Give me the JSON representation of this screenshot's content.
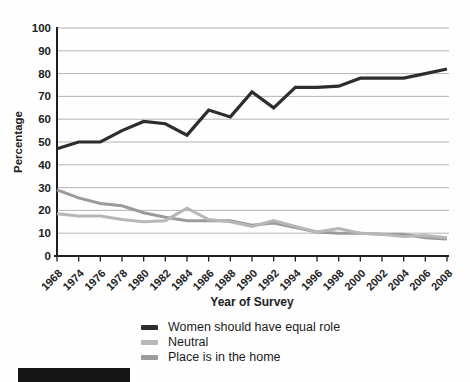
{
  "figure": {
    "ylabel": "Percentage",
    "xlabel": "Year of Survey"
  },
  "chart_data": {
    "type": "line",
    "title": "",
    "xlabel": "Year of Survey",
    "ylabel": "Percentage",
    "ylim": [
      0,
      100
    ],
    "ytick_step": 10,
    "grid": true,
    "legend_position": "bottom",
    "categories": [
      "1968",
      "1974",
      "1976",
      "1978",
      "1980",
      "1982",
      "1984",
      "1986",
      "1988",
      "1990",
      "1992",
      "1994",
      "1996",
      "1998",
      "2000",
      "2002",
      "2004",
      "2006",
      "2008"
    ],
    "series": [
      {
        "name": "Women should have equal role",
        "color": "#2d2d2d",
        "stroke_width": 3.2,
        "values": [
          47,
          50,
          50,
          55,
          59,
          58,
          53,
          64,
          61,
          72,
          65,
          74,
          74,
          74.5,
          78,
          78,
          78,
          80,
          82
        ]
      },
      {
        "name": "Neutral",
        "color": "#b7b7b7",
        "stroke_width": 3,
        "values": [
          18.5,
          17.5,
          17.5,
          16,
          15,
          15.5,
          21,
          16,
          15,
          13,
          15.5,
          13,
          10.5,
          12,
          10,
          9.5,
          8.5,
          9,
          8
        ]
      },
      {
        "name": "Place is in the home",
        "color": "#9b9b9b",
        "stroke_width": 3,
        "values": [
          29,
          25.5,
          23,
          22,
          19,
          17,
          15.5,
          15.5,
          15.5,
          13.5,
          14.5,
          12.5,
          10.5,
          10,
          10,
          9.5,
          9.5,
          8,
          7.5
        ]
      }
    ],
    "colors": {
      "grid": "#ababab",
      "axis": "#1f1f1f",
      "tick_text": "#222222"
    }
  }
}
